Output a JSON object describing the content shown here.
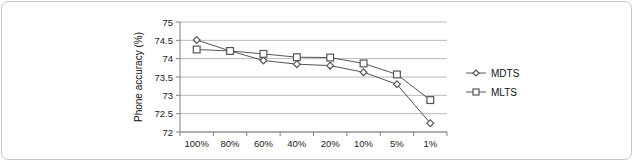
{
  "chart_data": {
    "type": "line",
    "title": "",
    "xlabel": "",
    "ylabel": "Phone accuracy (%)",
    "categories": [
      "100%",
      "80%",
      "60%",
      "40%",
      "20%",
      "10%",
      "5%",
      "1%"
    ],
    "series": [
      {
        "name": "MDTS",
        "marker": "diamond",
        "values": [
          74.51,
          74.21,
          73.95,
          73.85,
          73.81,
          73.63,
          73.3,
          72.24
        ]
      },
      {
        "name": "MLTS",
        "marker": "square",
        "values": [
          74.25,
          74.21,
          74.13,
          74.04,
          74.03,
          73.87,
          73.57,
          72.87
        ]
      }
    ],
    "ylim": [
      72,
      75
    ],
    "ytick_labels": [
      "72",
      "72.5",
      "73",
      "73.5",
      "74",
      "74.5",
      "75"
    ],
    "ytick_values": [
      72,
      72.5,
      73,
      73.5,
      74,
      74.5,
      75
    ],
    "grid": "horizontal",
    "legend_position": "right",
    "line_color": "#555555",
    "grid_color": "#b8b8b8",
    "axis_color": "#808080"
  }
}
